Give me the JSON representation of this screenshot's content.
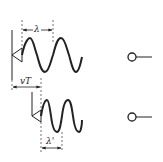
{
  "diagram": {
    "colors": {
      "stroke": "#222222",
      "background": "#ffffff"
    },
    "top_panel": {
      "wavelength_label": "λ",
      "source": "triangle-source-icon",
      "observer": "observer-icon"
    },
    "displacement_label": "vT",
    "bottom_panel": {
      "wavelength_label": "λ'",
      "source": "triangle-source-icon",
      "observer": "observer-icon"
    }
  }
}
